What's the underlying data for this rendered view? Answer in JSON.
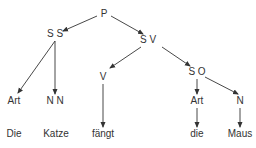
{
  "diagram": {
    "type": "syntax-tree",
    "colors": {
      "ink": "#333333",
      "background": "#ffffff"
    },
    "nodes": {
      "P": {
        "label": "P",
        "x": 104,
        "y": 17
      },
      "SS": {
        "label": "S S",
        "x": 55,
        "y": 37
      },
      "SV": {
        "label": "S V",
        "x": 148,
        "y": 43
      },
      "ArtL": {
        "label": "Art",
        "x": 14,
        "y": 104
      },
      "NN": {
        "label": "N N",
        "x": 55,
        "y": 104
      },
      "V": {
        "label": "V",
        "x": 103,
        "y": 80
      },
      "SO": {
        "label": "S O",
        "x": 197,
        "y": 75
      },
      "ArtR": {
        "label": "Art",
        "x": 197,
        "y": 104
      },
      "N": {
        "label": "N",
        "x": 240,
        "y": 104
      }
    },
    "words": {
      "w1": {
        "label": "Die",
        "x": 14,
        "y": 137
      },
      "w2": {
        "label": "Katze",
        "x": 56,
        "y": 137
      },
      "w3": {
        "label": "fängt",
        "x": 103,
        "y": 137
      },
      "w4": {
        "label": "die",
        "x": 197,
        "y": 137
      },
      "w5": {
        "label": "Maus",
        "x": 240,
        "y": 137
      }
    },
    "edges": [
      {
        "from": "P",
        "to": "SS",
        "x1": 97,
        "y1": 16,
        "x2": 63,
        "y2": 31,
        "arrow": true
      },
      {
        "from": "P",
        "to": "SV",
        "x1": 111,
        "y1": 16,
        "x2": 143,
        "y2": 34,
        "arrow": true
      },
      {
        "from": "SS",
        "to": "ArtL",
        "x1": 55,
        "y1": 41,
        "x2": 18,
        "y2": 93,
        "arrow": true
      },
      {
        "from": "SS",
        "to": "NN",
        "x1": 55,
        "y1": 41,
        "x2": 55,
        "y2": 94,
        "arrow": true
      },
      {
        "from": "SV",
        "to": "V",
        "x1": 141,
        "y1": 47,
        "x2": 110,
        "y2": 68,
        "arrow": true
      },
      {
        "from": "SV",
        "to": "SO",
        "x1": 162,
        "y1": 47,
        "x2": 190,
        "y2": 66,
        "arrow": true
      },
      {
        "from": "V",
        "to": "w3",
        "x1": 103,
        "y1": 84,
        "x2": 103,
        "y2": 127,
        "arrow": true
      },
      {
        "from": "SO",
        "to": "ArtR",
        "x1": 197,
        "y1": 79,
        "x2": 197,
        "y2": 94,
        "arrow": true
      },
      {
        "from": "SO",
        "to": "N",
        "x1": 205,
        "y1": 77,
        "x2": 238,
        "y2": 94,
        "arrow": true
      },
      {
        "from": "ArtR",
        "to": "w4",
        "x1": 197,
        "y1": 108,
        "x2": 197,
        "y2": 127,
        "arrow": true
      },
      {
        "from": "N",
        "to": "w5",
        "x1": 240,
        "y1": 108,
        "x2": 240,
        "y2": 127,
        "arrow": true
      }
    ]
  }
}
